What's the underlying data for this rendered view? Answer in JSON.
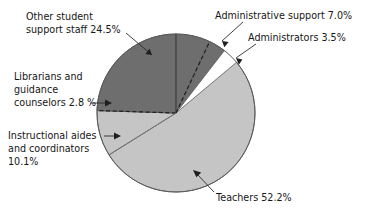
{
  "figure": {
    "title": "",
    "background_color": "#ffffff"
  },
  "chart_data": {
    "type": "pie",
    "title": "",
    "xlabel": "",
    "ylabel": "",
    "legend_position": "callout-labels",
    "grid": false,
    "units": "percent",
    "categories": [
      "Teachers",
      "Other student support staff",
      "Instructional aides and coordinators",
      "Administrative support",
      "Administrators",
      "Librarians and guidance counselors"
    ],
    "values": [
      52.2,
      24.5,
      10.1,
      7.0,
      3.5,
      2.8
    ],
    "slices": [
      {
        "key": "teachers",
        "name": "Teachers",
        "value": 52.2,
        "value_text": "52.2%",
        "label": "Teachers 52.2%",
        "color": "#c5c5c5",
        "start_angle_deg": 212.0,
        "end_angle_deg": 399.92
      },
      {
        "key": "other-student-support-staff",
        "name": "Other student support staff",
        "value": 24.5,
        "value_text": "24.5%",
        "label": "Other student support staff 24.5%",
        "color": "#6e6e6e",
        "start_angle_deg": 90.0,
        "end_angle_deg": 178.2
      },
      {
        "key": "instructional-aides-and-coordinators",
        "name": "Instructional aides and coordinators",
        "value": 10.1,
        "value_text": "10.1%",
        "label": "Instructional aides and coordinators 10.1%",
        "color": "#c5c5c5",
        "start_angle_deg": 178.2,
        "end_angle_deg": 212.0
      },
      {
        "key": "administrative-support",
        "name": "Administrative support",
        "value": 7.0,
        "value_text": "7.0%",
        "label": "Administrative support 7.0%",
        "color": "#6e6e6e",
        "start_angle_deg": 64.8,
        "end_angle_deg": 90.0
      },
      {
        "key": "administrators",
        "name": "Administrators",
        "value": 3.5,
        "value_text": "3.5%",
        "label": "Administrators 3.5%",
        "color": "#6e6e6e",
        "start_angle_deg": 52.2,
        "end_angle_deg": 64.8
      },
      {
        "key": "librarians-and-guidance-counselors",
        "name": "Librarians and guidance counselors",
        "value": 2.8,
        "value_text": "2.8 %",
        "label": "Librarians and guidance counselors 2.8 %",
        "color": "#6e6e6e",
        "start_angle_deg": 168.1,
        "end_angle_deg": 178.2
      }
    ],
    "geometry": {
      "center_x": 176,
      "center_y": 113,
      "radius": 79
    }
  },
  "callouts": {
    "other_student_support_staff": {
      "line1": "Other student",
      "line2": "support staff 24.5%"
    },
    "administrative_support": {
      "line1": "Administrative support 7.0%"
    },
    "administrators": {
      "line1": "Administrators 3.5%"
    },
    "librarians": {
      "line1": "Librarians and",
      "line2": "guidance",
      "line3": "counselors 2.8 %"
    },
    "instructional_aides": {
      "line1": "Instructional aides",
      "line2": "and coordinators",
      "line3": "10.1%"
    },
    "teachers": {
      "line1": "Teachers 52.2%"
    }
  },
  "colors": {
    "dark_slice": "#6e6e6e",
    "light_slice": "#c5c5c5",
    "outline": "#5a5a5a",
    "text": "#161616",
    "leader": "#2a2a2a",
    "background": "#ffffff"
  }
}
